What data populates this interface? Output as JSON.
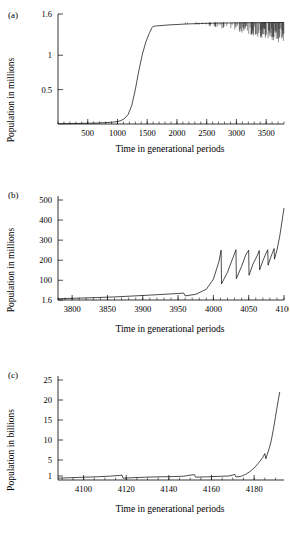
{
  "figure": {
    "panels": [
      {
        "id": "a",
        "label": "(a)",
        "xlabel": "Time in generational periods",
        "ylabel": "Population in millions"
      },
      {
        "id": "b",
        "label": "(b)",
        "xlabel": "Time in generational periods",
        "ylabel": "Population in millions"
      },
      {
        "id": "c",
        "label": "(c)",
        "xlabel": "Time in generational periods",
        "ylabel": "Population in billions"
      }
    ]
  },
  "chart_data": [
    {
      "type": "line",
      "panel": "a",
      "title": "",
      "xlabel": "Time in generational periods",
      "ylabel": "Population in millions",
      "xlim": [
        0,
        3800
      ],
      "ylim": [
        0,
        1.6
      ],
      "grid": false,
      "legend": null,
      "xticks": [
        500,
        1000,
        1500,
        2000,
        2500,
        3000,
        3500
      ],
      "xticklabels": [
        "500",
        "1000",
        "1500",
        "2000",
        "2500",
        "3000",
        "3500"
      ],
      "xminortick_step": 100,
      "yticks": [
        0.5,
        1,
        1.6
      ],
      "yticklabels": [
        "0.5",
        "1",
        "1.6"
      ],
      "description": "Sigmoidal growth to a plateau near 1.45 million, followed by increasingly dense downward spikes (chaotic crashes) after about 2100 generations.",
      "series": [
        {
          "name": "population",
          "x": [
            0,
            200,
            400,
            600,
            800,
            900,
            1000,
            1060,
            1120,
            1180,
            1240,
            1300,
            1360,
            1420,
            1480,
            1540,
            1580,
            1600,
            1640,
            1700,
            1800,
            1900,
            2000,
            2100,
            2200,
            2300,
            2400,
            2500,
            2600,
            2700,
            2800,
            2900,
            3000,
            3100,
            3200,
            3300,
            3400,
            3500,
            3600,
            3700,
            3800
          ],
          "y": [
            0.004,
            0.006,
            0.009,
            0.013,
            0.02,
            0.026,
            0.035,
            0.05,
            0.08,
            0.14,
            0.27,
            0.5,
            0.78,
            1.02,
            1.2,
            1.33,
            1.4,
            1.42,
            1.425,
            1.43,
            1.437,
            1.443,
            1.447,
            1.452,
            1.456,
            1.459,
            1.462,
            1.464,
            1.466,
            1.468,
            1.469,
            1.47,
            1.471,
            1.472,
            1.473,
            1.474,
            1.474,
            1.475,
            1.475,
            1.476,
            1.476
          ]
        }
      ],
      "noise_band": {
        "start_x": 2050,
        "end_x": 3800,
        "top_y": 1.476,
        "min_depth": 0.02,
        "max_depth": 0.33,
        "note": "Dense vertical crash spikes below the plateau, deepening and densifying toward the right edge."
      }
    },
    {
      "type": "line",
      "panel": "b",
      "title": "",
      "xlabel": "Time in generational periods",
      "ylabel": "Population in millions",
      "xlim": [
        3780,
        4100
      ],
      "ylim": [
        1.6,
        520
      ],
      "grid": false,
      "legend": null,
      "xticks": [
        3800,
        3850,
        3900,
        3950,
        4000,
        4050,
        4100
      ],
      "xticklabels": [
        "3800",
        "3850",
        "3900",
        "3950",
        "4000",
        "4050",
        "4100"
      ],
      "xminortick_step": 10,
      "yticks": [
        1.6,
        100,
        200,
        300,
        400,
        500
      ],
      "yticklabels": [
        "1.6",
        "100",
        "200",
        "300",
        "400",
        "500"
      ],
      "description": "Slow creep above 1.6 million until ~3960, then accelerating growth punctuated by sawtooth crashes of shortening period, ending at ~460 million.",
      "series": [
        {
          "name": "population",
          "x": [
            3780,
            3820,
            3860,
            3900,
            3930,
            3950,
            3958,
            3960,
            3975,
            3990,
            4000,
            4008,
            4011,
            4011.5,
            4020,
            4028,
            4032,
            4032.5,
            4040,
            4046,
            4050,
            4050.5,
            4056,
            4062,
            4065,
            4065.5,
            4070,
            4074,
            4077,
            4077.5,
            4081,
            4084,
            4086,
            4086.5,
            4090,
            4094,
            4100
          ],
          "y": [
            8,
            12,
            17,
            24,
            30,
            34,
            36,
            22,
            30,
            55,
            105,
            195,
            250,
            82,
            140,
            215,
            252,
            108,
            170,
            228,
            250,
            125,
            180,
            222,
            248,
            152,
            196,
            230,
            252,
            175,
            212,
            240,
            258,
            205,
            250,
            320,
            460
          ]
        }
      ]
    },
    {
      "type": "line",
      "panel": "c",
      "title": "",
      "xlabel": "Time in generational periods",
      "ylabel": "Population in billions",
      "xlim": [
        4088,
        4194
      ],
      "ylim": [
        0,
        26
      ],
      "grid": false,
      "legend": null,
      "xticks": [
        4100,
        4120,
        4140,
        4160,
        4180
      ],
      "xticklabels": [
        "4100",
        "4120",
        "4140",
        "4160",
        "4180"
      ],
      "xminortick_step": 5,
      "yticks": [
        1,
        5,
        10,
        15,
        20,
        25
      ],
      "yticklabels": [
        "1",
        "5",
        "10",
        "15",
        "20",
        "25"
      ],
      "description": "Population hovers near 1 billion with small crashes and recoveries until about 4175, then surges exponentially to roughly 22 billion with a small notch near 6 billion.",
      "series": [
        {
          "name": "population",
          "x": [
            4088,
            4095,
            4100,
            4106,
            4112,
            4117,
            4118,
            4118.5,
            4124,
            4130,
            4136,
            4142,
            4147,
            4150,
            4152,
            4152.5,
            4158,
            4163,
            4168,
            4170,
            4171,
            4171.5,
            4174,
            4176,
            4178,
            4180,
            4182,
            4184,
            4185,
            4185.5,
            4186,
            4187,
            4188,
            4189,
            4190,
            4191,
            4192
          ],
          "y": [
            0.45,
            0.6,
            0.7,
            0.8,
            0.95,
            1.15,
            1.25,
            0.45,
            0.6,
            0.72,
            0.8,
            0.85,
            0.95,
            1.2,
            1.35,
            0.7,
            0.8,
            0.9,
            1.0,
            1.25,
            1.4,
            0.75,
            0.95,
            1.4,
            2.1,
            3.0,
            4.2,
            5.6,
            6.6,
            5.3,
            6.2,
            7.8,
            9.8,
            12.6,
            15.8,
            19.0,
            22.0
          ]
        }
      ]
    }
  ]
}
